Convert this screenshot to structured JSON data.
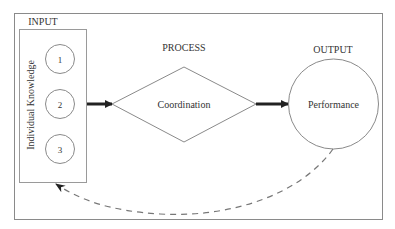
{
  "diagram": {
    "type": "input-process-output",
    "colors": {
      "stroke": "#8a8a8a",
      "text": "#333333",
      "arrow": "#222222",
      "dash": "#777777",
      "background": "#ffffff"
    },
    "input": {
      "heading": "INPUT",
      "box_label": "Individual Knowledge",
      "items": [
        "1",
        "2",
        "3"
      ]
    },
    "process": {
      "heading": "PROCESS",
      "label": "Coordination"
    },
    "output": {
      "heading": "OUTPUT",
      "label": "Performance"
    },
    "edges": [
      {
        "from": "input",
        "to": "process",
        "style": "solid-thick"
      },
      {
        "from": "process",
        "to": "output",
        "style": "solid-thick"
      },
      {
        "from": "output",
        "to": "input",
        "style": "dashed-curved-feedback"
      }
    ]
  }
}
